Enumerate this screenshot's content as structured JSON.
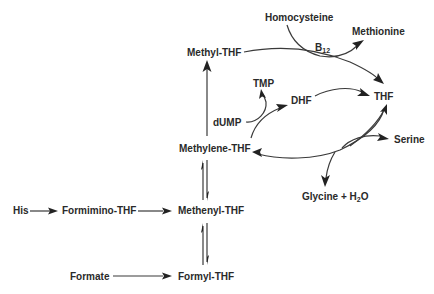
{
  "diagram": {
    "nodes": {
      "homocysteine": "Homocysteine",
      "methionine": "Methionine",
      "b12": "B",
      "b12_sub": "12",
      "methyl_thf": "Methyl-THF",
      "tmp": "TMP",
      "dhf": "DHF",
      "thf": "THF",
      "dump": "dUMP",
      "methylene_thf": "Methylene-THF",
      "serine": "Serine",
      "glycine": "Glycine + H",
      "glycine_sub": "2",
      "glycine_tail": "O",
      "his": "His",
      "formimino_thf": "Formimino-THF",
      "methenyl_thf": "Methenyl-THF",
      "formate": "Formate",
      "formyl_thf": "Formyl-THF"
    },
    "edges": [
      {
        "from": "His",
        "to": "Formimino-THF",
        "type": "forward"
      },
      {
        "from": "Formimino-THF",
        "to": "Methenyl-THF",
        "type": "forward"
      },
      {
        "from": "Formate",
        "to": "Formyl-THF",
        "type": "forward"
      },
      {
        "from": "Methenyl-THF",
        "to": "Methylene-THF",
        "type": "reversible"
      },
      {
        "from": "Formyl-THF",
        "to": "Methenyl-THF",
        "type": "reversible"
      },
      {
        "from": "Methylene-THF",
        "to": "Methyl-THF",
        "type": "forward"
      },
      {
        "from": "Methyl-THF",
        "to": "THF",
        "type": "forward",
        "coupled": "Homocysteine -> Methionine",
        "cofactor": "B12"
      },
      {
        "from": "Methylene-THF",
        "to": "DHF",
        "type": "forward",
        "coupled": "dUMP -> TMP"
      },
      {
        "from": "DHF",
        "to": "THF",
        "type": "forward"
      },
      {
        "from": "THF",
        "to": "Methylene-THF",
        "type": "forward",
        "coupled": "Serine -> Glycine + H2O"
      }
    ],
    "colors": {
      "text": "#2a2a2a",
      "line": "#3a3a3a",
      "background": "#ffffff"
    }
  }
}
